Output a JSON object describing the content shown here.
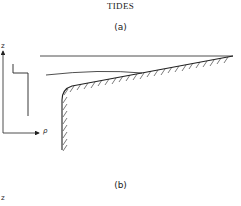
{
  "header": {
    "title": "TIDES"
  },
  "panels": [
    {
      "label": "(a)"
    },
    {
      "label": "(b)"
    }
  ],
  "axes": {
    "vertical_label": "z",
    "horizontal_label": "ρ",
    "panel_b_vertical_label": "z"
  },
  "colors": {
    "ink": "#222222",
    "background": "#ffffff"
  }
}
